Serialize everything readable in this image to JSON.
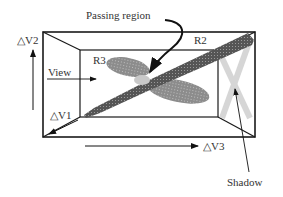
{
  "labels": {
    "passing_region": "Passing region",
    "r2": "R2",
    "r3": "R3",
    "view": "View",
    "dv1": "△V1",
    "dv2": "△V2",
    "dv3": "△V3",
    "shadow": "Shadow"
  },
  "colors": {
    "box_stroke": "#1a1a1a",
    "cluster_r2": "#4a4a4a",
    "cluster_r3": "#8a8a8a",
    "passing_region": "#c8c8c8",
    "shadow": "#cfcfcf"
  }
}
